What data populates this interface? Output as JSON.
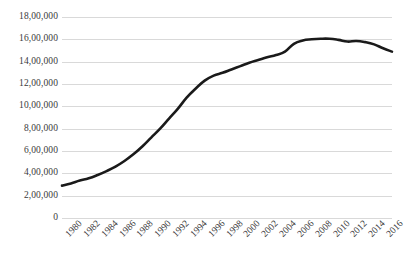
{
  "chart_data": {
    "type": "line",
    "title": "",
    "subtitle": "",
    "xlabel": "",
    "ylabel": "",
    "grid": "horizontal",
    "legend": "none",
    "line_color": "#1a1a1a",
    "grid_color": "#d9d9d9",
    "background_color": "#ffffff",
    "xlim": [
      1980,
      2017
    ],
    "ylim": [
      0,
      1800000
    ],
    "ytick_labels": [
      "18,00,000",
      "16,00,000",
      "14,00,000",
      "12,00,000",
      "10,00,000",
      "8,00,000",
      "6,00,000",
      "4,00,000",
      "2,00,000",
      "0"
    ],
    "ytick_values": [
      1800000,
      1600000,
      1400000,
      1200000,
      1000000,
      800000,
      600000,
      400000,
      200000,
      0
    ],
    "xtick_labels": [
      "1980",
      "1982",
      "1984",
      "1986",
      "1988",
      "1990",
      "1992",
      "1994",
      "1996",
      "1998",
      "2000",
      "2002",
      "2004",
      "2006",
      "2008",
      "2010",
      "2012",
      "2014",
      "2016"
    ],
    "xtick_values": [
      1980,
      1982,
      1984,
      1986,
      1988,
      1990,
      1992,
      1994,
      1996,
      1998,
      2000,
      2002,
      2004,
      2006,
      2008,
      2010,
      2012,
      2014,
      2016
    ],
    "x": [
      1980,
      1981,
      1982,
      1983,
      1984,
      1985,
      1986,
      1987,
      1988,
      1989,
      1990,
      1991,
      1992,
      1993,
      1994,
      1995,
      1996,
      1997,
      1998,
      1999,
      2000,
      2001,
      2002,
      2003,
      2004,
      2005,
      2006,
      2007,
      2008,
      2009,
      2010,
      2011,
      2012,
      2013,
      2014,
      2015,
      2016,
      2017
    ],
    "values": [
      290000,
      310000,
      335000,
      355000,
      385000,
      420000,
      460000,
      510000,
      570000,
      640000,
      720000,
      800000,
      890000,
      980000,
      1080000,
      1160000,
      1230000,
      1275000,
      1300000,
      1330000,
      1360000,
      1390000,
      1415000,
      1440000,
      1460000,
      1490000,
      1560000,
      1590000,
      1600000,
      1605000,
      1605000,
      1595000,
      1580000,
      1585000,
      1575000,
      1555000,
      1520000,
      1490000
    ],
    "series": [
      {
        "name": "Series 1",
        "values": [
          290000,
          310000,
          335000,
          355000,
          385000,
          420000,
          460000,
          510000,
          570000,
          640000,
          720000,
          800000,
          890000,
          980000,
          1080000,
          1160000,
          1230000,
          1275000,
          1300000,
          1330000,
          1360000,
          1390000,
          1415000,
          1440000,
          1460000,
          1490000,
          1560000,
          1590000,
          1600000,
          1605000,
          1605000,
          1595000,
          1580000,
          1585000,
          1575000,
          1555000,
          1520000,
          1490000
        ]
      }
    ]
  }
}
